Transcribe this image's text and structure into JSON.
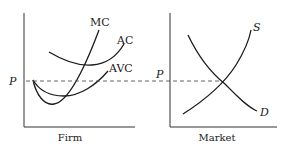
{
  "panels": {
    "firm": {
      "caption": "Firm",
      "price_label": "P",
      "curves": {
        "mc": "MC",
        "ac": "AC",
        "avc": "AVC"
      }
    },
    "market": {
      "caption": "Market",
      "price_label": "P",
      "curves": {
        "supply": "S",
        "demand": "D"
      }
    }
  },
  "colors": {
    "line": "#1a1a1a",
    "axis": "#333333",
    "dashed": "#555555",
    "background": "#ffffff"
  }
}
